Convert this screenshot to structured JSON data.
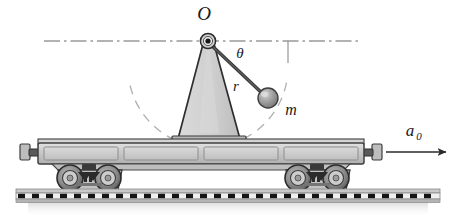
{
  "figure": {
    "domain": "Diagram",
    "width": 454,
    "height": 224,
    "background_color": "#ffffff"
  },
  "labels": {
    "pivot": "O",
    "angle": "θ",
    "rod_length": "r",
    "bob_mass": "m",
    "acceleration": "a",
    "acceleration_subscript": "0"
  },
  "colors": {
    "outline": "#1a1a1a",
    "pedestal_fill": "#d4d4d4",
    "pedestal_stroke": "#2b2b2b",
    "bob_fill": "#9a9a9a",
    "bob_highlight": "#c9c9c9",
    "bob_stroke": "#3d3d3d",
    "rod_stroke": "#3a3a3a",
    "car_body_fill": "#c2c2c2",
    "car_panel_fill": "#d8d8d8",
    "car_stroke": "#4a4a4a",
    "wheel_fill": "#8f8f8f",
    "wheel_dark": "#3a3a3a",
    "rail_fill": "#b8b8b8",
    "tie_fill": "#1c1c1c",
    "dash_dot_line": "#5a5a5a",
    "dashed_arc": "#a8a8a8",
    "ground_shadow": "#dcdcdc"
  },
  "geometry": {
    "pivot": {
      "x": 208,
      "y": 41,
      "hub_outer_radius": 8,
      "hub_inner_radius": 3
    },
    "bob": {
      "x": 268,
      "y": 98,
      "radius": 10
    },
    "rod": {
      "x1": 210,
      "y1": 44,
      "x2": 262,
      "y2": 94,
      "stroke_width": 3
    },
    "horizontal_reference_line": {
      "x1": 44,
      "y1": 41,
      "x2": 362,
      "y2": 41
    },
    "vertical_tick": {
      "x": 288,
      "y1": 41,
      "y2": 62
    },
    "arc": {
      "cx": 208,
      "cy": 41,
      "radius": 80,
      "start_angle_deg": 20,
      "end_angle_deg": 160
    },
    "pedestal": {
      "apex_x": 208,
      "apex_y": 46,
      "base_left_x": 178,
      "base_right_x": 240,
      "base_y": 140
    },
    "car_deck": {
      "x": 36,
      "y": 140,
      "width": 330,
      "height": 28
    },
    "bogies": [
      {
        "cx": 88,
        "cy": 178
      },
      {
        "cx": 316,
        "cy": 178
      }
    ],
    "rail": {
      "x": 18,
      "y": 192,
      "width": 420,
      "height": 10
    },
    "arrow": {
      "x1": 384,
      "y1": 152,
      "x2": 442,
      "y2": 152
    }
  },
  "elements": {
    "pivot_name": "pivot-point",
    "rod_name": "pendulum-rod",
    "bob_name": "pendulum-bob",
    "pedestal_name": "support-pedestal",
    "railcar_name": "railroad-flatcar",
    "track_name": "railroad-track",
    "arrow_name": "acceleration-arrow",
    "arc_name": "swing-arc",
    "reference_line_name": "horizontal-reference-line"
  }
}
